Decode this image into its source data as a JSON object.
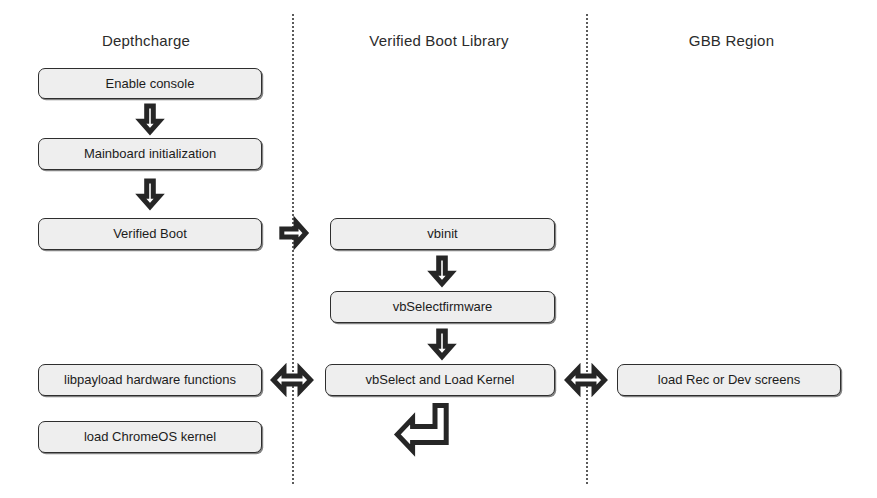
{
  "diagram": {
    "columns": [
      {
        "id": "depthcharge",
        "label": "Depthcharge"
      },
      {
        "id": "verified-boot-library",
        "label": "Verified Boot Library"
      },
      {
        "id": "gbb-region",
        "label": "GBB Region"
      }
    ],
    "nodes": {
      "enable_console": "Enable console",
      "mainboard_initialization": "Mainboard initialization",
      "verified_boot": "Verified Boot",
      "libpayload_hardware_functions": "libpayload hardware functions",
      "load_chromeos_kernel": "load ChromeOS kernel",
      "vbinit": "vbinit",
      "vbselectfirmware": "vbSelectfirmware",
      "vbselect_and_load_kernel": "vbSelect and Load Kernel",
      "load_rec_or_dev_screens": "load Rec or Dev screens"
    },
    "connectors": {
      "console_to_mainboard": "down-arrow-icon",
      "mainboard_to_verified_boot": "down-arrow-icon",
      "verified_boot_to_vbinit": "right-arrow-icon",
      "vbinit_to_vbselectfirmware": "down-arrow-icon",
      "vbselectfirmware_to_vbselect_kernel": "down-arrow-icon",
      "libpayload_to_vbselect_kernel": "double-arrow-icon",
      "vbselect_kernel_to_gbb": "double-arrow-icon",
      "vbselect_kernel_return": "bent-return-arrow-icon"
    },
    "colors": {
      "node_fill": "#eeeeee",
      "node_border": "#2e2e2e",
      "divider": "#5a5a5a",
      "arrow_fill": "#ffffff",
      "arrow_stroke": "#262626",
      "text": "#1c1c1c",
      "background": "#ffffff"
    }
  }
}
